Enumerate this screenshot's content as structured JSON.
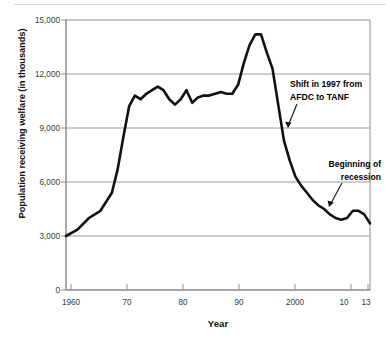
{
  "chart_data": {
    "type": "line",
    "title": "",
    "xlabel": "Year",
    "ylabel": "Population receiving welfare (in thousands)",
    "xlim": [
      1960,
      2013
    ],
    "ylim": [
      0,
      15000
    ],
    "grid": true,
    "legend": "none",
    "y_ticks": [
      "0",
      "3,000",
      "6,000",
      "9,000",
      "12,000",
      "15,000"
    ],
    "y_tick_values": [
      0,
      3000,
      6000,
      9000,
      12000,
      15000
    ],
    "x_ticks": [
      "1960",
      "70",
      "80",
      "90",
      "2000",
      "10",
      "13"
    ],
    "x_tick_values": [
      1960,
      1970,
      1980,
      1990,
      2000,
      2010,
      2013
    ],
    "series": [
      {
        "name": "Population receiving welfare",
        "x": [
          1960,
          1962,
          1964,
          1966,
          1968,
          1969,
          1970,
          1971,
          1972,
          1973,
          1974,
          1975,
          1976,
          1977,
          1978,
          1979,
          1980,
          1981,
          1982,
          1983,
          1984,
          1985,
          1986,
          1987,
          1988,
          1989,
          1990,
          1991,
          1992,
          1993,
          1994,
          1995,
          1996,
          1997,
          1998,
          1999,
          2000,
          2001,
          2002,
          2003,
          2004,
          2005,
          2006,
          2007,
          2008,
          2009,
          2010,
          2011,
          2012,
          2013
        ],
        "values": [
          3000,
          3350,
          4000,
          4400,
          5400,
          6700,
          8500,
          10200,
          10800,
          10600,
          10900,
          11100,
          11300,
          11100,
          10600,
          10300,
          10600,
          11100,
          10400,
          10700,
          10800,
          10800,
          10900,
          11000,
          10900,
          10900,
          11400,
          12600,
          13600,
          14200,
          14200,
          13200,
          12300,
          10300,
          8300,
          7200,
          6300,
          5800,
          5400,
          5000,
          4700,
          4500,
          4200,
          4000,
          3900,
          4000,
          4400,
          4400,
          4200,
          3700
        ]
      }
    ],
    "annotations": [
      {
        "name": "shift-annotation",
        "line1": "Shift in 1997 from",
        "line2": "AFDC to TANF",
        "points_to_year": 1997
      },
      {
        "name": "recession-annotation",
        "line1": "Beginning of",
        "line2": "recession",
        "points_to_year": 2008
      }
    ],
    "colors": {
      "line": "#111111",
      "grid": "#9a9a9a",
      "axis": "#8c8c8c",
      "background": "#ffffff",
      "text": "#111111"
    }
  }
}
